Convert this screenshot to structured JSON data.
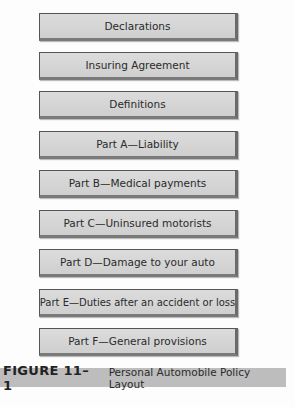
{
  "diagram": {
    "sections": [
      {
        "label": "Declarations"
      },
      {
        "label": "Insuring Agreement"
      },
      {
        "label": "Definitions"
      },
      {
        "label": "Part A—Liability"
      },
      {
        "label": "Part B—Medical payments"
      },
      {
        "label": "Part C—Uninsured motorists"
      },
      {
        "label": "Part D—Damage to your auto"
      },
      {
        "label": "Part E—Duties after an accident or loss"
      },
      {
        "label": "Part F—General provisions"
      }
    ]
  },
  "caption": {
    "figure_label": "FIGURE 11–1",
    "title": "Personal Automobile Policy Layout",
    "background": "#bdbdbd"
  }
}
